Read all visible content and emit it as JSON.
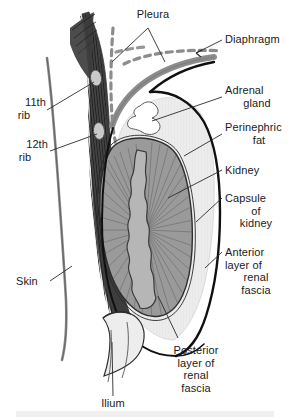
{
  "figure": {
    "background_color": "#ffffff",
    "text_color": "#1a1a1a",
    "width": 294,
    "height": 420
  },
  "labels": {
    "pleura": "Pleura",
    "diaphragm": "Diaphragm",
    "adrenal_gland_line1": "Adrenal",
    "adrenal_gland_line2": "gland",
    "perinephric_fat_line1": "Perinephric",
    "perinephric_fat_line2": "fat",
    "kidney": "Kidney",
    "capsule_line1": "Capsule",
    "capsule_line2": "of",
    "capsule_line3": "kidney",
    "anterior_fascia_line1": "Anterior",
    "anterior_fascia_line2": "layer of",
    "anterior_fascia_line3": "renal",
    "anterior_fascia_line4": "fascia",
    "posterior_fascia_line1": "Posterior",
    "posterior_fascia_line2": "layer of",
    "posterior_fascia_line3": "renal",
    "posterior_fascia_line4": "fascia",
    "rib11_line1": "11th",
    "rib11_line2": "rib",
    "rib12_line1": "12th",
    "rib12_line2": "rib",
    "skin": "Skin",
    "ilium": "Ilium"
  },
  "structures": [
    {
      "name": "skin",
      "fill": "#8a8a8a",
      "stroke": "#4a4a4a"
    },
    {
      "name": "muscle",
      "fill": "#3d3d3d",
      "stroke": "#2a2a2a"
    },
    {
      "name": "rib-11",
      "fill": "#c8c8c8",
      "stroke": "#555555"
    },
    {
      "name": "rib-12",
      "fill": "#c8c8c8",
      "stroke": "#555555"
    },
    {
      "name": "pleura",
      "fill": "none",
      "stroke": "#8c8c8c"
    },
    {
      "name": "diaphragm",
      "fill": "#8c8c8c",
      "stroke": "#8c8c8c"
    },
    {
      "name": "adrenal-gland",
      "fill": "#ffffff",
      "stroke": "#555555"
    },
    {
      "name": "perinephric-fat",
      "fill": "#ececec",
      "stroke": "#c0c0c0"
    },
    {
      "name": "kidney-cortex",
      "fill": "#9a9a9a",
      "stroke": "#3a3a3a"
    },
    {
      "name": "kidney-medulla",
      "fill": "#b4b4b4",
      "stroke": "#3a3a3a"
    },
    {
      "name": "capsule-of-kidney",
      "fill": "none",
      "stroke": "#2a2a2a"
    },
    {
      "name": "anterior-renal-fascia",
      "fill": "none",
      "stroke": "#111111"
    },
    {
      "name": "posterior-renal-fascia",
      "fill": "none",
      "stroke": "#111111"
    },
    {
      "name": "ilium",
      "fill": "#e8e8e8",
      "stroke": "#3a3a3a"
    }
  ],
  "colors": {
    "leader_line": "#2a2a2a",
    "muscle_dark": "#3d3d3d",
    "bone_light": "#c8c8c8",
    "fat_light": "#ececec",
    "kidney_gray": "#9a9a9a",
    "pleura_gray": "#8c8c8c",
    "footer_band": "#f2f0ee"
  }
}
